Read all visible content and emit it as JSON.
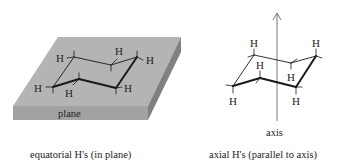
{
  "left_panel": {
    "title": "equatorial H's (in plane)",
    "plane_label": "plane",
    "h_labels": [
      "H",
      "H",
      "H",
      "H",
      "H",
      "H"
    ]
  },
  "right_panel": {
    "title": "axial H's (parallel to axis)",
    "axis_label": "axis",
    "h_labels": [
      "H",
      "H",
      "H",
      "H",
      "H",
      "H"
    ]
  },
  "colors": {
    "slab_top": "#b4b4b4",
    "slab_front": "#9a9a9a",
    "slab_side": "#7e7e7e",
    "ink": "#1a1a1a"
  }
}
